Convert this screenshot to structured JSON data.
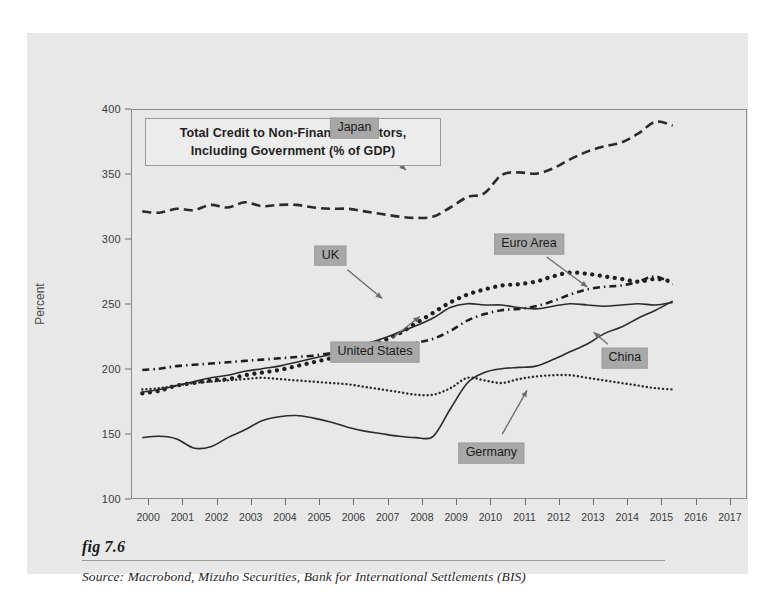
{
  "figure": {
    "fig_number": "fig 7.6",
    "source": "Source:  Macrobond, Mizuho Securities, Bank for International Settlements (BIS)",
    "panel_bg": "#e8e8e8",
    "callout_bg": "#a8a8a8"
  },
  "chart_data": {
    "type": "line",
    "title": "Total Credit to Non-Financial Sectors, Including Government (% of GDP)",
    "title_line1": "Total Credit to Non-Financial Sectors,",
    "title_line2": "Including Government (% of GDP)",
    "xlabel": "",
    "ylabel": "Percent",
    "xlim": [
      1999.5,
      2017.5
    ],
    "ylim": [
      100,
      400
    ],
    "yticks": [
      100,
      150,
      200,
      250,
      300,
      350,
      400
    ],
    "xticks": [
      2000,
      2001,
      2002,
      2003,
      2004,
      2005,
      2006,
      2007,
      2008,
      2009,
      2010,
      2011,
      2012,
      2013,
      2014,
      2015,
      2016,
      2017
    ],
    "grid": false,
    "legend_position": "inline-callouts",
    "annotations": [
      {
        "label": "Japan",
        "x": 2006.0,
        "y": 386,
        "arrow_to_x": 2007.6,
        "arrow_to_y": 352
      },
      {
        "label": "UK",
        "x": 2005.3,
        "y": 288,
        "arrow_to_x": 2006.9,
        "arrow_to_y": 253
      },
      {
        "label": "Euro Area",
        "x": 2011.1,
        "y": 297,
        "arrow_to_x": 2012.9,
        "arrow_to_y": 262
      },
      {
        "label": "United States",
        "x": 2006.6,
        "y": 214,
        "arrow_to_x": 2008.0,
        "arrow_to_y": 243
      },
      {
        "label": "China",
        "x": 2013.9,
        "y": 209,
        "arrow_to_x": 2012.9,
        "arrow_to_y": 231
      },
      {
        "label": "Germany",
        "x": 2010.0,
        "y": 136,
        "arrow_to_x": 2011.1,
        "arrow_to_y": 187
      }
    ],
    "series": [
      {
        "name": "Japan",
        "style": "dashed",
        "color": "#2b2b2b",
        "x": [
          1999.8,
          2000.3,
          2000.8,
          2001.3,
          2001.8,
          2002.3,
          2002.8,
          2003.3,
          2003.8,
          2004.3,
          2004.8,
          2005.3,
          2005.8,
          2006.3,
          2006.8,
          2007.3,
          2007.8,
          2008.3,
          2008.8,
          2009.3,
          2009.8,
          2010.3,
          2010.8,
          2011.3,
          2011.8,
          2012.3,
          2012.8,
          2013.3,
          2013.8,
          2014.3,
          2014.8,
          2015.3
        ],
        "values": [
          322,
          321,
          324,
          323,
          327,
          325,
          329,
          326,
          327,
          327,
          325,
          324,
          324,
          322,
          320,
          318,
          317,
          318,
          325,
          333,
          336,
          350,
          352,
          351,
          355,
          362,
          368,
          372,
          375,
          382,
          391,
          388
        ]
      },
      {
        "name": "UK",
        "style": "dotted",
        "color": "#1f1f1f",
        "x": [
          1999.8,
          2000.3,
          2000.8,
          2001.3,
          2001.8,
          2002.3,
          2002.8,
          2003.3,
          2003.8,
          2004.3,
          2004.8,
          2005.3,
          2005.8,
          2006.3,
          2006.8,
          2007.3,
          2007.8,
          2008.3,
          2008.8,
          2009.3,
          2009.8,
          2010.3,
          2010.8,
          2011.3,
          2011.8,
          2012.3,
          2012.8,
          2013.3,
          2013.8,
          2014.3,
          2014.8,
          2015.3
        ],
        "values": [
          182,
          184,
          188,
          190,
          192,
          193,
          196,
          198,
          200,
          203,
          206,
          209,
          212,
          217,
          222,
          228,
          236,
          244,
          252,
          258,
          262,
          265,
          266,
          268,
          272,
          275,
          274,
          272,
          270,
          268,
          270,
          268
        ]
      },
      {
        "name": "Euro Area",
        "style": "dashdot",
        "color": "#1f1f1f",
        "x": [
          1999.8,
          2000.3,
          2000.8,
          2001.3,
          2001.8,
          2002.3,
          2002.8,
          2003.3,
          2003.8,
          2004.3,
          2004.8,
          2005.3,
          2005.8,
          2006.3,
          2006.8,
          2007.3,
          2007.8,
          2008.3,
          2008.8,
          2009.3,
          2009.8,
          2010.3,
          2010.8,
          2011.3,
          2011.8,
          2012.3,
          2012.8,
          2013.3,
          2013.8,
          2014.3,
          2014.8,
          2015.3
        ],
        "values": [
          200,
          201,
          203,
          204,
          205,
          206,
          207,
          208,
          209,
          210,
          211,
          213,
          214,
          215,
          217,
          219,
          221,
          224,
          230,
          238,
          243,
          246,
          247,
          249,
          253,
          258,
          262,
          264,
          265,
          268,
          272,
          266
        ]
      },
      {
        "name": "United States",
        "style": "solid",
        "color": "#2b2b2b",
        "x": [
          1999.8,
          2000.3,
          2000.8,
          2001.3,
          2001.8,
          2002.3,
          2002.8,
          2003.3,
          2003.8,
          2004.3,
          2004.8,
          2005.3,
          2005.8,
          2006.3,
          2006.8,
          2007.3,
          2007.8,
          2008.3,
          2008.8,
          2009.3,
          2009.8,
          2010.3,
          2010.8,
          2011.3,
          2011.8,
          2012.3,
          2012.8,
          2013.3,
          2013.8,
          2014.3,
          2014.8,
          2015.3
        ],
        "values": [
          183,
          185,
          188,
          191,
          194,
          196,
          199,
          201,
          203,
          206,
          209,
          212,
          216,
          220,
          224,
          229,
          234,
          240,
          248,
          251,
          250,
          250,
          248,
          247,
          249,
          251,
          250,
          249,
          250,
          251,
          250,
          252
        ]
      },
      {
        "name": "Germany",
        "style": "finedot",
        "color": "#2b2b2b",
        "x": [
          1999.8,
          2000.3,
          2000.8,
          2001.3,
          2001.8,
          2002.3,
          2002.8,
          2003.3,
          2003.8,
          2004.3,
          2004.8,
          2005.3,
          2005.8,
          2006.3,
          2006.8,
          2007.3,
          2007.8,
          2008.3,
          2008.8,
          2009.3,
          2009.8,
          2010.3,
          2010.8,
          2011.3,
          2011.8,
          2012.3,
          2012.8,
          2013.3,
          2013.8,
          2014.3,
          2014.8,
          2015.3
        ],
        "values": [
          185,
          186,
          188,
          190,
          191,
          192,
          193,
          194,
          193,
          192,
          191,
          190,
          189,
          187,
          185,
          183,
          181,
          181,
          186,
          194,
          192,
          190,
          193,
          195,
          196,
          196,
          194,
          192,
          190,
          188,
          186,
          185
        ]
      },
      {
        "name": "China",
        "style": "solid",
        "color": "#2b2b2b",
        "x": [
          1999.8,
          2000.3,
          2000.8,
          2001.3,
          2001.8,
          2002.3,
          2002.8,
          2003.3,
          2003.8,
          2004.3,
          2004.8,
          2005.3,
          2005.8,
          2006.3,
          2006.8,
          2007.3,
          2007.8,
          2008.3,
          2008.8,
          2009.3,
          2009.8,
          2010.3,
          2010.8,
          2011.3,
          2011.8,
          2012.3,
          2012.8,
          2013.3,
          2013.8,
          2014.3,
          2014.8,
          2015.3
        ],
        "values": [
          148,
          149,
          147,
          140,
          141,
          148,
          154,
          161,
          164,
          165,
          163,
          160,
          156,
          153,
          151,
          149,
          148,
          149,
          170,
          190,
          198,
          201,
          202,
          203,
          208,
          214,
          220,
          228,
          233,
          240,
          246,
          253
        ]
      }
    ]
  }
}
